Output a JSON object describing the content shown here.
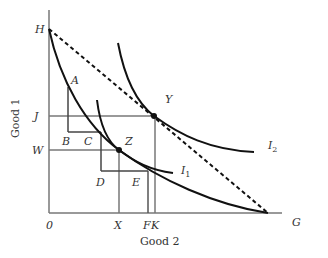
{
  "figure": {
    "axes": {
      "x_label": "Good 2",
      "y_label": "Good 1",
      "origin_label": "0"
    },
    "point_labels": {
      "H": "H",
      "A": "A",
      "J": "J",
      "B": "B",
      "C": "C",
      "W": "W",
      "Z": "Z",
      "Y": "Y",
      "D": "D",
      "E": "E",
      "X": "X",
      "F": "F",
      "K": "K",
      "G": "G"
    },
    "curves": {
      "I1": {
        "letter": "I",
        "subscript": "1"
      },
      "I2": {
        "letter": "I",
        "subscript": "2"
      }
    },
    "elements": [
      "Dashed budget line from H to G-axis intercept",
      "Solid curved constraint from H to Good 2 axis",
      "Indifference curve I1 tangent at Z",
      "Indifference curve I2 tangent at Y",
      "Step lines A-B-C and C-D-E",
      "Guide lines J, W, X, F, K"
    ],
    "colors": {
      "curve": "#111111",
      "guide": "#777777",
      "axis": "#777777",
      "text": "#333333"
    }
  }
}
